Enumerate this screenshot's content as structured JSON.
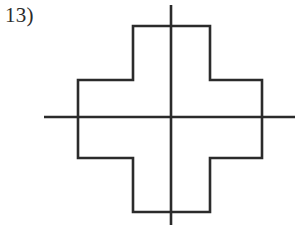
{
  "page": {
    "width": 301,
    "height": 231,
    "background_color": "#ffffff",
    "stroke_color": "#2b2b2b",
    "stroke_width": 2.6
  },
  "problem": {
    "number_label": "13)"
  },
  "figure": {
    "center": {
      "x": 171,
      "y": 117
    },
    "shape": {
      "name": "plus-polygon",
      "fill": "none",
      "points": "133,26 210,26 210,80 262,80 262,158 210,158 210,212 133,212 133,158 78,158 78,80 133,80"
    },
    "axes": {
      "horizontal": {
        "x1": 44,
        "y1": 117,
        "x2": 295,
        "y2": 117
      },
      "vertical": {
        "x1": 171,
        "y1": 5,
        "x2": 171,
        "y2": 225
      }
    }
  },
  "chart_data": {
    "type": "table",
    "title": "13)",
    "xlabel": "",
    "ylabel": "",
    "categories": [
      "vertices",
      "lines-of-symmetry-shown"
    ],
    "values": [
      12,
      2
    ],
    "annotations": [
      "Plus / cross shaped polygon (12 sides)",
      "Vertical line of symmetry drawn through center",
      "Horizontal line of symmetry drawn through center"
    ]
  }
}
